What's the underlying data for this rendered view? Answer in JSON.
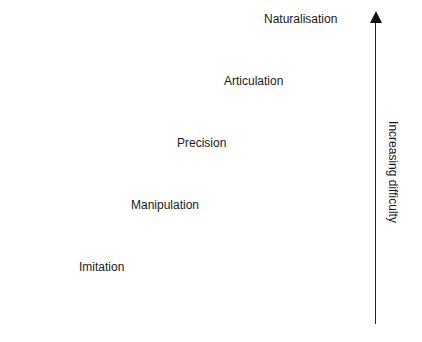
{
  "diagram": {
    "levels": [
      {
        "label": "Imitation"
      },
      {
        "label": "Manipulation"
      },
      {
        "label": "Precision"
      },
      {
        "label": "Articulation"
      },
      {
        "label": "Naturalisation"
      }
    ],
    "axis_label": "Increasing difficulty"
  }
}
